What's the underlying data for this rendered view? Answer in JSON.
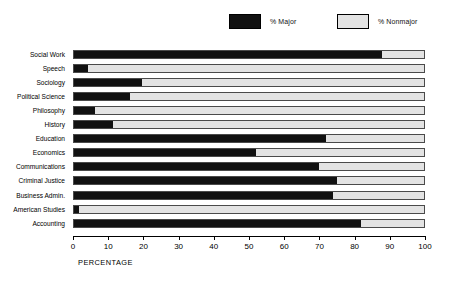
{
  "legend": {
    "position": "top",
    "entries": [
      {
        "label": "% Major",
        "color": "#111111",
        "name": "major"
      },
      {
        "label": "% Nonmajor",
        "color": "#e3e3e3",
        "name": "nonmajor"
      }
    ]
  },
  "axis": {
    "title": "PERCENTAGE",
    "ticks": [
      "0",
      "10",
      "20",
      "30",
      "40",
      "50",
      "60",
      "70",
      "80",
      "90",
      "100"
    ]
  },
  "chart_data": {
    "type": "bar",
    "orientation": "horizontal",
    "stacked": true,
    "title": "",
    "subtitle": "",
    "xlabel": "PERCENTAGE",
    "ylabel": "",
    "xlim": [
      0,
      100
    ],
    "xticks": [
      0,
      10,
      20,
      30,
      40,
      50,
      60,
      70,
      80,
      90,
      100
    ],
    "grid": false,
    "legend_position": "top",
    "categories": [
      "Social Work",
      "Speech",
      "Sociology",
      "Political Science",
      "Philosophy",
      "History",
      "Education",
      "Economics",
      "Communications",
      "Criminal Justice",
      "Business Admin.",
      "American Studies",
      "Accounting"
    ],
    "series": [
      {
        "name": "% Major",
        "color": "#111111",
        "values": [
          88,
          4,
          19.5,
          16,
          6,
          11,
          72,
          52,
          70,
          75,
          74,
          1.5,
          82
        ]
      },
      {
        "name": "% Nonmajor",
        "color": "#e3e3e3",
        "values": [
          12,
          96,
          80.5,
          84,
          94,
          89,
          28,
          48,
          30,
          25,
          26,
          98.5,
          18
        ]
      }
    ]
  }
}
